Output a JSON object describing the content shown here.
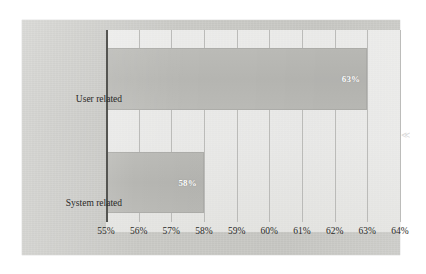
{
  "chart_data": {
    "type": "bar",
    "orientation": "horizontal",
    "title": "",
    "subtitle": "",
    "xlabel": "",
    "ylabel": "",
    "categories": [
      "User related",
      "System related"
    ],
    "values": [
      63,
      58
    ],
    "value_labels": [
      "63%",
      "58%"
    ],
    "xlim": [
      55,
      64
    ],
    "xticks": [
      55,
      56,
      57,
      58,
      59,
      60,
      61,
      62,
      63,
      64
    ],
    "xtick_labels": [
      "55%",
      "56%",
      "57%",
      "58%",
      "59%",
      "60%",
      "61%",
      "62%",
      "63%",
      "64%"
    ],
    "grid": true,
    "grid_axis": "x",
    "legend": false,
    "legend_position": "none",
    "bar_color": "#b8b8b4",
    "plot_background": "#c8c8c4",
    "gridline_color": "#b3b3b0",
    "axis_color": "#555552",
    "value_label_color": "#ffffff"
  },
  "artifacts": {
    "edge_mark": "≪"
  }
}
